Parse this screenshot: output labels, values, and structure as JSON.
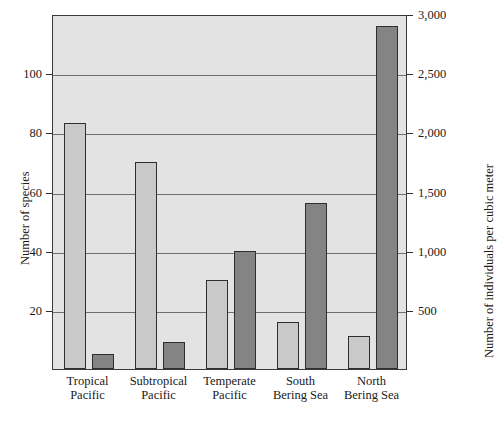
{
  "chart_data": {
    "type": "bar",
    "title": "",
    "subtitle": "",
    "categories": [
      "Tropical Pacific",
      "Subtropical Pacific",
      "Temperate Pacific",
      "South Bering Sea",
      "North Bering Sea"
    ],
    "category_lines": [
      [
        "Tropical",
        "Pacific"
      ],
      [
        "Subtropical",
        "Pacific"
      ],
      [
        "Temperate",
        "Pacific"
      ],
      [
        "South",
        "Bering Sea"
      ],
      [
        "North",
        "Bering Sea"
      ]
    ],
    "series": [
      {
        "name": "Number of species",
        "axis": "left",
        "color": "#c9c9c9",
        "values": [
          83,
          70,
          30,
          16,
          11
        ]
      },
      {
        "name": "Number of individuals per cubic meter",
        "axis": "right",
        "color": "#848484",
        "values": [
          125,
          225,
          1000,
          1400,
          2900
        ]
      }
    ],
    "ylabel": "Number of species",
    "ylabel_right": "Number of individuals per cubic meter",
    "xlabel": "",
    "ylim": [
      0,
      120
    ],
    "ylim_right": [
      0,
      3000
    ],
    "yticks": [
      20,
      40,
      60,
      80,
      100
    ],
    "ytick_labels": [
      "20",
      "40",
      "60",
      "80",
      "100"
    ],
    "yticks_right": [
      500,
      1000,
      1500,
      2000,
      2500,
      3000
    ],
    "ytick_labels_right": [
      "500",
      "1,000",
      "1,500",
      "2,000",
      "2,500",
      "3,000"
    ],
    "grid": true,
    "grid_axis": "y",
    "legend": false,
    "plot_background": "#e3e3e3",
    "frame_color": "#3a3a3a"
  }
}
